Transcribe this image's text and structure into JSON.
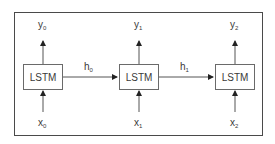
{
  "diagram": {
    "type": "unrolled-lstm",
    "cells": [
      {
        "label": "LSTM",
        "input": {
          "base": "x",
          "sub": "0"
        },
        "output": {
          "base": "y",
          "sub": "0"
        }
      },
      {
        "label": "LSTM",
        "input": {
          "base": "x",
          "sub": "1"
        },
        "output": {
          "base": "y",
          "sub": "1"
        }
      },
      {
        "label": "LSTM",
        "input": {
          "base": "x",
          "sub": "2"
        },
        "output": {
          "base": "y",
          "sub": "2"
        }
      }
    ],
    "hidden": [
      {
        "base": "h",
        "sub": "0"
      },
      {
        "base": "h",
        "sub": "1"
      }
    ]
  }
}
